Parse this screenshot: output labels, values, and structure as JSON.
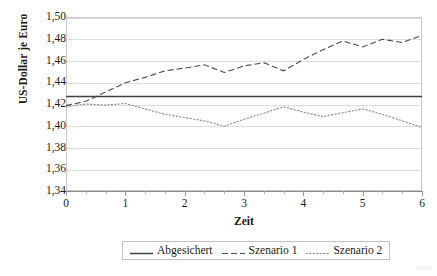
{
  "chart_data": {
    "type": "line",
    "title": "",
    "xlabel": "Zeit",
    "ylabel": "US-Dollar je Euro",
    "xlim": [
      0,
      6
    ],
    "ylim": [
      1.34,
      1.5
    ],
    "ytick_labels": [
      "1,50",
      "1,48",
      "1,46",
      "1,44",
      "1,42",
      "1,40",
      "1,38",
      "1,36",
      "1,34"
    ],
    "ytick_values": [
      1.5,
      1.48,
      1.46,
      1.44,
      1.42,
      1.4,
      1.38,
      1.36,
      1.34
    ],
    "xtick_labels": [
      "0",
      "1",
      "2",
      "3",
      "4",
      "5",
      "6"
    ],
    "xtick_values": [
      0,
      1,
      2,
      3,
      4,
      5,
      6
    ],
    "xminor_step": 0.3333,
    "grid": "horizontal",
    "legend_position": "bottom",
    "x": [
      0,
      0.333,
      0.667,
      1,
      1.333,
      1.667,
      2,
      2.333,
      2.667,
      3,
      3.333,
      3.667,
      4,
      4.333,
      4.667,
      5,
      5.333,
      5.667,
      6
    ],
    "series": [
      {
        "name": "Abgesichert",
        "style": "solid",
        "color": "#3f3f3f",
        "constant": 1.427,
        "values": [
          1.427,
          1.427,
          1.427,
          1.427,
          1.427,
          1.427,
          1.427,
          1.427,
          1.427,
          1.427,
          1.427,
          1.427,
          1.427,
          1.427,
          1.427,
          1.427,
          1.427,
          1.427,
          1.427
        ]
      },
      {
        "name": "Szenario 1",
        "style": "dashed",
        "color": "#4a4a4a",
        "values": [
          1.4185,
          1.4225,
          1.431,
          1.4395,
          1.4445,
          1.4505,
          1.453,
          1.456,
          1.449,
          1.455,
          1.458,
          1.4505,
          1.461,
          1.47,
          1.478,
          1.4725,
          1.4795,
          1.4765,
          1.483
        ]
      },
      {
        "name": "Szenario 2",
        "style": "dotted",
        "color": "#8a8a8a",
        "values": [
          1.4175,
          1.42,
          1.419,
          1.4205,
          1.4155,
          1.4105,
          1.4075,
          1.4045,
          1.3995,
          1.406,
          1.4115,
          1.4175,
          1.4125,
          1.4085,
          1.412,
          1.4155,
          1.4105,
          1.4045,
          1.3985
        ]
      }
    ]
  },
  "legend": {
    "items": [
      {
        "label": "Abgesichert",
        "style": "solid"
      },
      {
        "label": "Szenario 1",
        "style": "dashed"
      },
      {
        "label": "Szenario 2",
        "style": "dotted"
      }
    ]
  }
}
